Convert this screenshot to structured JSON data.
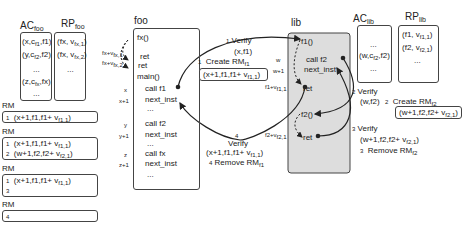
{
  "foo_tables": {
    "ac": {
      "title": "AC",
      "title_sub": "foo",
      "rows": [
        {
          "pre": "(x,c",
          "sub": "f1",
          "post": ",f1)"
        },
        {
          "pre": "(y,c",
          "sub": "f2",
          "post": ",f2)"
        },
        {
          "pre": "...",
          "sub": "",
          "post": ""
        },
        {
          "pre": "(z,c",
          "sub": "fx",
          "post": ",fx)"
        },
        {
          "pre": "...",
          "sub": "",
          "post": ""
        }
      ]
    },
    "rp": {
      "title": "RP",
      "title_sub": "foo",
      "rows": [
        {
          "pre": "(fx, v",
          "sub": "fx,1",
          "post": ")"
        },
        {
          "pre": "(fx, v",
          "sub": "fx,2",
          "post": ")"
        },
        {
          "pre": "...",
          "sub": "",
          "post": ""
        }
      ]
    }
  },
  "rm_states": [
    {
      "label": "RM",
      "rows": [
        {
          "n": "1",
          "pre": "(x+1,f1,f1+ v",
          "sub": "f1,1",
          "post": ")"
        }
      ]
    },
    {
      "label": "RM",
      "rows": [
        {
          "n": "1",
          "pre": "(x+1,f1,f1+ v",
          "sub": "f1,1",
          "post": ")"
        },
        {
          "n": "2",
          "pre": "(w+1,f2,f2+ v",
          "sub": "f2,1",
          "post": ")"
        }
      ]
    },
    {
      "label": "RM",
      "rows": [
        {
          "n": "1",
          "pre": "(x+1,f1,f1+ v",
          "sub": "f1,1",
          "post": ")"
        },
        {
          "n": "3",
          "pre": "",
          "sub": "",
          "post": ""
        }
      ]
    },
    {
      "label": "RM",
      "rows": [
        {
          "n": "4",
          "pre": "",
          "sub": "",
          "post": ""
        }
      ]
    }
  ],
  "foo_module": {
    "title": "foo",
    "lines": [
      "fx()",
      "ret",
      "ret",
      "main()",
      "call f1",
      "next_inst",
      "...",
      "call f2",
      "next_inst",
      "...",
      "call fx",
      "next_inst",
      "..."
    ],
    "ret_labels": [
      {
        "pre": "fx+v",
        "sub": "fx,1"
      },
      {
        "pre": "fx+v",
        "sub": "fx,2"
      }
    ],
    "addresses": [
      "x",
      "x+1",
      "y",
      "y+1",
      "z",
      "z+1"
    ]
  },
  "lib_module": {
    "title": "lib",
    "lines": [
      "f1()",
      "call f2",
      "next_inst",
      "ret",
      "f2()",
      "ret"
    ],
    "addresses": [
      "w",
      "w+1"
    ],
    "ret_labels": [
      {
        "pre": "f1+v",
        "sub": "f1,1"
      },
      {
        "pre": "f2+v",
        "sub": "f2,1"
      }
    ]
  },
  "lib_tables": {
    "ac": {
      "title": "AC",
      "title_sub": "lib",
      "rows": [
        {
          "pre": "...",
          "sub": "",
          "post": ""
        },
        {
          "pre": "(w,c",
          "sub": "f2",
          "post": ",f2)"
        },
        {
          "pre": "...",
          "sub": "",
          "post": ""
        }
      ]
    },
    "rp": {
      "title": "RP",
      "title_sub": "lib",
      "rows": [
        {
          "pre": "(f1, v",
          "sub": "f1,1",
          "post": ")"
        },
        {
          "pre": "(f2, v",
          "sub": "f2,1",
          "post": ")"
        },
        {
          "pre": "...",
          "sub": "",
          "post": ""
        }
      ]
    }
  },
  "annotations": {
    "step1_verify": {
      "n": "1",
      "label": "Verify",
      "args": "(x,f1)"
    },
    "step1_create": {
      "n": "1",
      "label": "Create RM",
      "sub": "f1",
      "entry_pre": "(x+1,f1,f1+ v",
      "entry_sub": "f1,1",
      "entry_post": ")"
    },
    "step2_verify": {
      "n": "2",
      "label": "Verify",
      "args": "(w,f2)"
    },
    "step2_create": {
      "n": "2",
      "label": "Create RM",
      "sub": "f2",
      "entry_pre": "(w+1,f2,f2+ v",
      "entry_sub": "f2,1",
      "entry_post": ")"
    },
    "step3_verify": {
      "n": "3",
      "label": "Verify",
      "args_pre": "(w+1,f2,f2+ v",
      "args_sub": "f2,1",
      "args_post": ")"
    },
    "step3_remove": {
      "n": "3",
      "label": "Remove RM",
      "sub": "f2"
    },
    "step4_verify": {
      "n": "4",
      "label": "Verify",
      "args_pre": "(x+1,f1,f1+ v",
      "args_sub": "f1,1",
      "args_post": ")"
    },
    "step4_remove": {
      "n": "4",
      "label": "Remove RM",
      "sub": "f1"
    }
  }
}
